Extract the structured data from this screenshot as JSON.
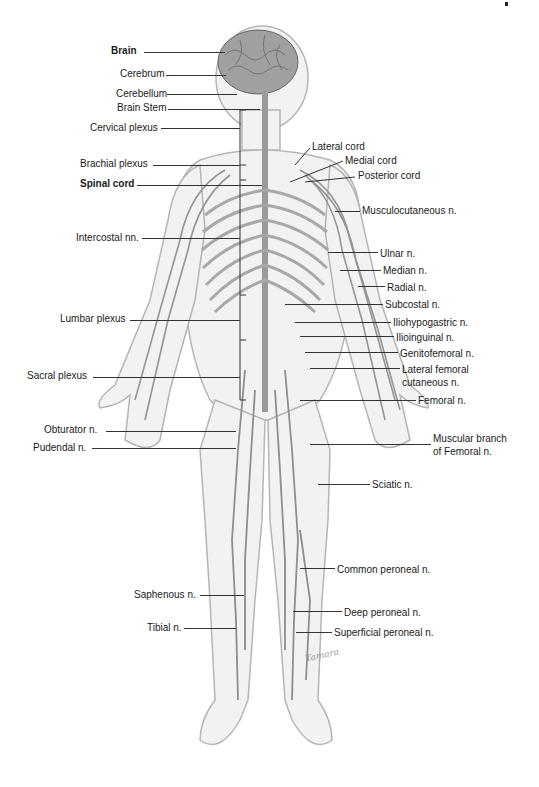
{
  "figure": {
    "signature": "Tamara"
  },
  "colors": {
    "body_fill": "#f2f2f2",
    "body_outline": "#b5b5b5",
    "nerve": "#9a9a9a",
    "nerve_dark": "#7a7a7a",
    "brain": "#8e8e8e",
    "leader": "#333333",
    "text": "#1a1a1a"
  },
  "labels_left": [
    {
      "id": "brain",
      "text": "Brain",
      "bold": true
    },
    {
      "id": "cerebrum",
      "text": "Cerebrum",
      "bold": false
    },
    {
      "id": "cerebellum",
      "text": "Cerebellum",
      "bold": false
    },
    {
      "id": "brain_stem",
      "text": "Brain Stem",
      "bold": false
    },
    {
      "id": "cervical_plexus",
      "text": "Cervical plexus",
      "bold": false
    },
    {
      "id": "brachial_plexus",
      "text": "Brachial plexus",
      "bold": false
    },
    {
      "id": "spinal_cord",
      "text": "Spinal cord",
      "bold": true
    },
    {
      "id": "intercostal",
      "text": "Intercostal nn.",
      "bold": false
    },
    {
      "id": "lumbar_plexus",
      "text": "Lumbar plexus",
      "bold": false
    },
    {
      "id": "sacral_plexus",
      "text": "Sacral plexus",
      "bold": false
    },
    {
      "id": "obturator",
      "text": "Obturator n.",
      "bold": false
    },
    {
      "id": "pudendal",
      "text": "Pudendal n.",
      "bold": false
    },
    {
      "id": "saphenous",
      "text": "Saphenous n.",
      "bold": false
    },
    {
      "id": "tibial",
      "text": "Tibial n.",
      "bold": false
    }
  ],
  "labels_right": [
    {
      "id": "lateral_cord",
      "text": "Lateral cord"
    },
    {
      "id": "medial_cord",
      "text": "Medial cord"
    },
    {
      "id": "posterior_cord",
      "text": "Posterior cord"
    },
    {
      "id": "musculocutaneous",
      "text": "Musculocutaneous n."
    },
    {
      "id": "ulnar",
      "text": "Ulnar n."
    },
    {
      "id": "median",
      "text": "Median n."
    },
    {
      "id": "radial",
      "text": "Radial n."
    },
    {
      "id": "subcostal",
      "text": "Subcostal n."
    },
    {
      "id": "iliohypogastric",
      "text": "Iliohypogastric n."
    },
    {
      "id": "ilioinguinal",
      "text": "Ilioinguinal n."
    },
    {
      "id": "genitofemoral",
      "text": "Genitofemoral n."
    },
    {
      "id": "lateral_femoral_1",
      "text": "Lateral femoral"
    },
    {
      "id": "lateral_femoral_2",
      "text": "cutaneous n."
    },
    {
      "id": "femoral",
      "text": "Femoral n."
    },
    {
      "id": "muscular_branch_1",
      "text": "Muscular branch"
    },
    {
      "id": "muscular_branch_2",
      "text": "of Femoral n."
    },
    {
      "id": "sciatic",
      "text": "Sciatic n."
    },
    {
      "id": "common_peroneal",
      "text": "Common peroneal n."
    },
    {
      "id": "deep_peroneal",
      "text": "Deep peroneal n."
    },
    {
      "id": "superficial_peroneal",
      "text": "Superficial peroneal n."
    }
  ]
}
